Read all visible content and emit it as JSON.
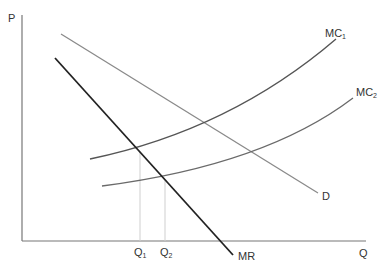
{
  "diagram": {
    "title": "",
    "axes": {
      "y_label": "P",
      "x_label": "Q"
    },
    "curves": [
      {
        "id": "mc1",
        "label": "MC",
        "subscript": "1",
        "color": "#555555"
      },
      {
        "id": "mc2",
        "label": "MC",
        "subscript": "2",
        "color": "#6a6a6a"
      },
      {
        "id": "demand",
        "label": "D",
        "color": "#8a8a8a"
      },
      {
        "id": "mr",
        "label": "MR",
        "color": "#222222"
      }
    ],
    "quantity_markers": [
      {
        "label": "Q",
        "subscript": "1"
      },
      {
        "label": "Q",
        "subscript": "2"
      }
    ],
    "colors": {
      "axis": "#777777",
      "guide": "#cccccc",
      "text": "#333333"
    }
  }
}
